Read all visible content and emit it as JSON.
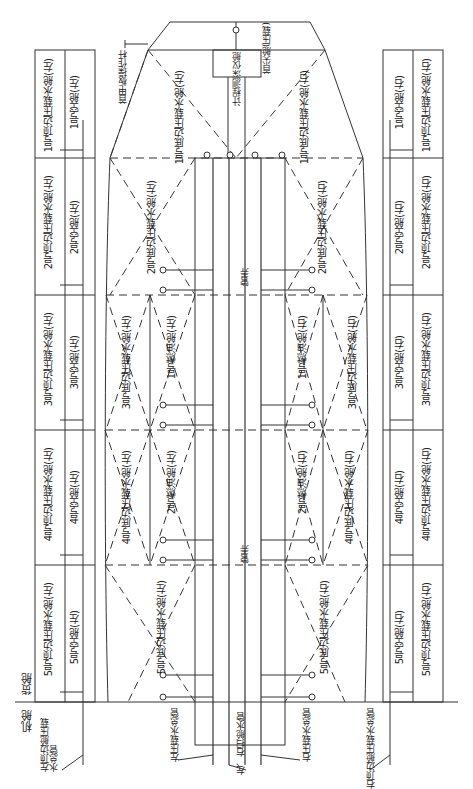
{
  "regions": {
    "cargo_hold": "货舱",
    "engine_room": "机舱"
  },
  "fore": {
    "forepeak": "首尖舱(压载)",
    "deck_operating_rod": "首甲板操作杆",
    "remote_gauge": "计程测深仪舱"
  },
  "pipe_tunnel": [
    "管弄",
    "管弄"
  ],
  "left_topside_tanks": [
    "1号顶边压载水舱(左)",
    "2号顶边压载水舱(左)",
    "3号顶边压载水舱(左)",
    "4号顶边压载水舱(左)",
    "5号顶边压载水舱(左)"
  ],
  "left_void_spaces": [
    "1号空舱(左)",
    "2号空舱(左)",
    "3号空舱(左)",
    "4号空舱(左)",
    "5号空舱(左)"
  ],
  "right_void_spaces": [
    "1号空舱(右)",
    "2号空舱(右)",
    "3号空舱(右)",
    "4号空舱(右)",
    "5号空舱(右)"
  ],
  "right_topside_tanks": [
    "1号顶边压载水舱(右)",
    "2号顶边压载水舱(右)",
    "3号顶边压载水舱(右)",
    "4号顶边压载水舱(右)",
    "5号顶边压载水舱(右)"
  ],
  "left_double_bottom_tanks": [
    "1号底边压载水舱(左)",
    "2号底边压载水舱(左)",
    "3号底边压载水舱(左)",
    "4号底边压载水舱(左)",
    "5号底边压载水舱(左)"
  ],
  "right_double_bottom_tanks": [
    "1号底边压载水舱(右)",
    "2号底边压载水舱(右)",
    "3号底边压载水舱(右)",
    "4号底边压载水舱(右)",
    "5号底边压载水舱(右)"
  ],
  "fuel_tanks_left": [
    "1号燃油舱(左)",
    "2号燃油舱(左)"
  ],
  "fuel_tanks_right": [
    "1号燃油舱(右)",
    "2号燃油舱(右)"
  ],
  "mains": {
    "left_topside_main": "左顶边舱压载水总管",
    "left_ballast_main": "左压载水总管",
    "bilge_main": "左、右扫舱水管",
    "right_ballast_main": "右压载水总管",
    "right_topside_main": "右顶边舱压载水总管"
  },
  "colors": {
    "line": "#333333",
    "background": "#ffffff"
  }
}
